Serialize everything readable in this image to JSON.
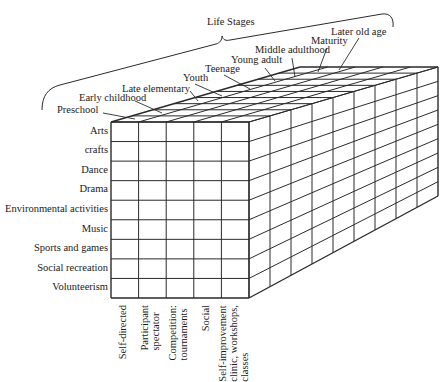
{
  "diagram": {
    "type": "3D cube matrix",
    "group_label": "Life Stages",
    "life_stages": [
      "Preschool",
      "Early childhood",
      "Late elementary",
      "Youth",
      "Teenage",
      "Young adult",
      "Middle adulthood",
      "Maturity",
      "Later old age"
    ],
    "activity_areas": [
      "Arts",
      "crafts",
      "Dance",
      "Drama",
      "Environmental activities",
      "Music",
      "Sports and games",
      "Social recreation",
      "Volunteerism"
    ],
    "formats": [
      {
        "line1": "Self-directed",
        "line2": ""
      },
      {
        "line1": "Participant",
        "line2": "spectator"
      },
      {
        "line1": "Competition:",
        "line2": "tournaments"
      },
      {
        "line1": "Social",
        "line2": ""
      },
      {
        "line1": "Self-improvement",
        "line2": "clinic, workshops,",
        "line3": "classes"
      }
    ],
    "grid": {
      "rows": 9,
      "columns": 5,
      "depth": 9
    }
  },
  "colors": {
    "line": "#2a2a2a",
    "background": "#ffffff"
  }
}
